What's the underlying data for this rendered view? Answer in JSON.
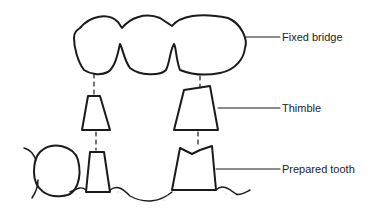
{
  "diagram": {
    "title": "",
    "labels": {
      "fixed_bridge": "Fixed bridge",
      "thimble": "Thimble",
      "prepared_tooth": "Prepared tooth"
    },
    "components": [
      "fixed-bridge",
      "thimble",
      "prepared-tooth",
      "adjacent-tooth",
      "gum-line"
    ],
    "colors": {
      "line": "#1a1a1a",
      "background": "#ffffff"
    }
  }
}
